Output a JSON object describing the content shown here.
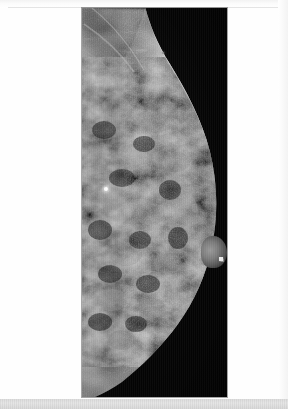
{
  "document": {
    "type": "scanned-radiograph-page",
    "page_background_color": "#fefefe",
    "scanner_strip_color": "#e0e0e0"
  },
  "film": {
    "name": "mammogram-film",
    "modality": "mammography",
    "view": "breast in profile, craniocaudal / mediolateral oblique style projection",
    "laterality_orientation": "chest wall at left edge, nipple pointing right",
    "background_color": "#040404",
    "film_left_px": 82,
    "film_top_px": 8,
    "film_width_px": 145,
    "film_height_px": 389
  },
  "anatomy": {
    "pectoral_region_label": "pectoral / axillary tissue",
    "fibroglandular_label": "heterogeneously dense fibroglandular tissue",
    "skin_line_label": "skin line",
    "nipple_label": "nipple in profile",
    "retromammary_fat_label": "retromammary fat"
  },
  "markers": [
    {
      "name": "calcification-marker",
      "description": "bright punctate opacity within glandular tissue",
      "x_px": 105,
      "y_px": 188,
      "color": "#fdfdfd"
    },
    {
      "name": "nipple-bb-marker",
      "description": "small radiopaque skin marker lateral to nipple",
      "x_px": 221,
      "y_px": 259,
      "color": "#f4f4f4"
    },
    {
      "name": "faint-background-dot",
      "description": "faint speck in collimated background field",
      "x_px": 163,
      "y_px": 53,
      "color": "#8e8e8e"
    }
  ],
  "overlay_text": []
}
